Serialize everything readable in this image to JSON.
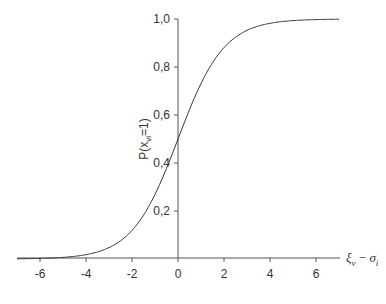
{
  "chart_data": {
    "type": "line",
    "title": "",
    "xlabel": "ξv − σi",
    "xlabel_parts": {
      "main1": "ξ",
      "sub1": "v",
      "minus": " − ",
      "main2": "σ",
      "sub2": "i"
    },
    "ylabel": "P(xvi=1)",
    "ylabel_parts": {
      "prefix": "P(x",
      "sub": "vi",
      "suffix": "=1)"
    },
    "xlim": [
      -7,
      7
    ],
    "ylim": [
      0,
      1
    ],
    "x_ticks": [
      -6,
      -4,
      -2,
      0,
      2,
      4,
      6
    ],
    "x_tick_labels": [
      "-6",
      "-4",
      "-2",
      "0",
      "2",
      "4",
      "6"
    ],
    "y_ticks": [
      0.2,
      0.4,
      0.6,
      0.8,
      1.0
    ],
    "y_tick_labels": [
      "0,2",
      "0,4",
      "0,6",
      "0,8",
      "1,0"
    ],
    "grid": false,
    "legend": null,
    "series": [
      {
        "name": "logistic",
        "function": "1/(1+exp(-x))",
        "x": [
          -7,
          -6,
          -5,
          -4,
          -3,
          -2,
          -1,
          0,
          1,
          2,
          3,
          4,
          5,
          6,
          7
        ],
        "y": [
          0.001,
          0.002,
          0.007,
          0.018,
          0.047,
          0.119,
          0.269,
          0.5,
          0.731,
          0.881,
          0.953,
          0.982,
          0.993,
          0.998,
          0.999
        ]
      }
    ],
    "colors": {
      "axis": "#555555",
      "curve": "#333333",
      "text": "#333333"
    }
  }
}
